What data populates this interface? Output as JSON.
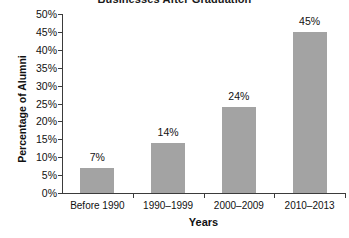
{
  "chart_data": {
    "type": "bar",
    "title": "Businesses After Graduation",
    "xlabel": "Years",
    "ylabel": "Percentage of Alumni",
    "categories": [
      "Before 1990",
      "1990–1999",
      "2000–2009",
      "2010–2013"
    ],
    "values": [
      7,
      14,
      24,
      45
    ],
    "value_labels": [
      "7%",
      "14%",
      "24%",
      "45%"
    ],
    "ylim": [
      0,
      50
    ],
    "ytick_values": [
      0,
      5,
      10,
      15,
      20,
      25,
      30,
      35,
      40,
      45,
      50
    ],
    "ytick_labels": [
      "0%",
      "5%",
      "10%",
      "15%",
      "20%",
      "25%",
      "30%",
      "35%",
      "40%",
      "45%",
      "50%"
    ],
    "grid": false,
    "legend": null,
    "bar_color": "#a3a3a3",
    "axis_color": "#3b3b3b",
    "text_color": "#111111"
  }
}
